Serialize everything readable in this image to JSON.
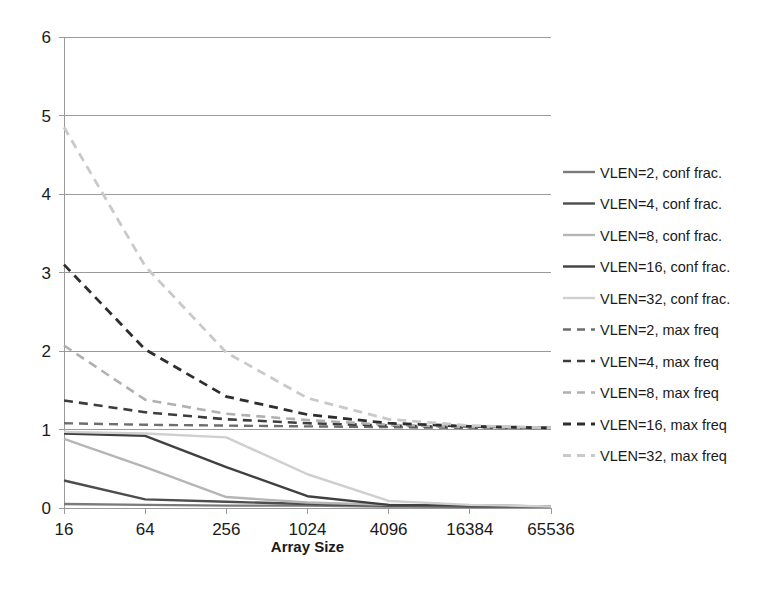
{
  "chart_data": {
    "type": "line",
    "title": "",
    "xlabel": "Array Size",
    "ylabel": "",
    "x": [
      16,
      64,
      256,
      1024,
      4096,
      16384,
      65536
    ],
    "xtick_labels": [
      "16",
      "64",
      "256",
      "1024",
      "4096",
      "16384",
      "65536"
    ],
    "ytick_labels": [
      "0",
      "1",
      "2",
      "3",
      "4",
      "5",
      "6"
    ],
    "ylim": [
      0,
      6
    ],
    "yticks": [
      0,
      1,
      2,
      3,
      4,
      5,
      6
    ],
    "grid": "horizontal",
    "legend_position": "right",
    "xscale": "log2-categorical",
    "series": [
      {
        "name": "VLEN=2, conf frac.",
        "style": "solid",
        "color": "#7a7a7a",
        "width": 2.4,
        "values": [
          0.05,
          0.04,
          0.03,
          0.03,
          0.02,
          0.02,
          0.02
        ]
      },
      {
        "name": "VLEN=4, conf frac.",
        "style": "solid",
        "color": "#4d4d4d",
        "width": 2.4,
        "values": [
          0.35,
          0.11,
          0.08,
          0.05,
          0.03,
          0.02,
          0.02
        ]
      },
      {
        "name": "VLEN=8, conf frac.",
        "style": "solid",
        "color": "#b5b5b5",
        "width": 2.4,
        "values": [
          0.88,
          0.52,
          0.14,
          0.07,
          0.04,
          0.03,
          0.02
        ]
      },
      {
        "name": "VLEN=16, conf frac.",
        "style": "solid",
        "color": "#404040",
        "width": 2.4,
        "values": [
          0.95,
          0.92,
          0.52,
          0.15,
          0.04,
          0.03,
          0.02
        ]
      },
      {
        "name": "VLEN=32, conf frac.",
        "style": "solid",
        "color": "#cfcfcf",
        "width": 2.4,
        "values": [
          0.97,
          0.95,
          0.9,
          0.43,
          0.09,
          0.04,
          0.02
        ]
      },
      {
        "name": "VLEN=2, max freq",
        "style": "dashed",
        "color": "#6e6e6e",
        "width": 2.4,
        "values": [
          1.08,
          1.06,
          1.05,
          1.04,
          1.03,
          1.02,
          1.02
        ]
      },
      {
        "name": "VLEN=4, max freq",
        "style": "dashed",
        "color": "#3d3d3d",
        "width": 2.6,
        "values": [
          1.37,
          1.22,
          1.13,
          1.08,
          1.05,
          1.03,
          1.02
        ]
      },
      {
        "name": "VLEN=8, max freq",
        "style": "dashed",
        "color": "#b0b0b0",
        "width": 2.6,
        "values": [
          2.07,
          1.38,
          1.2,
          1.12,
          1.06,
          1.03,
          1.02
        ]
      },
      {
        "name": "VLEN=16, max freq",
        "style": "dashed",
        "color": "#2e2e2e",
        "width": 2.8,
        "values": [
          3.1,
          2.02,
          1.42,
          1.19,
          1.08,
          1.04,
          1.02
        ]
      },
      {
        "name": "VLEN=32, max freq",
        "style": "dashed",
        "color": "#c9c9c9",
        "width": 2.8,
        "values": [
          4.85,
          3.08,
          1.98,
          1.4,
          1.13,
          1.05,
          1.02
        ]
      }
    ]
  },
  "legend": {
    "items": [
      "VLEN=2, conf frac.",
      "VLEN=4, conf frac.",
      "VLEN=8, conf frac.",
      "VLEN=16, conf frac.",
      "VLEN=32, conf frac.",
      "VLEN=2, max freq",
      "VLEN=4, max freq",
      "VLEN=8, max freq",
      "VLEN=16, max freq",
      "VLEN=32, max freq"
    ]
  }
}
